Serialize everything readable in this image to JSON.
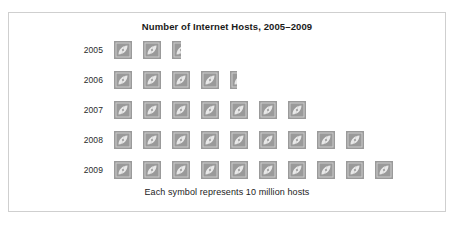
{
  "chart_data": {
    "type": "bar",
    "subtype": "pictograph",
    "title": "Number of Internet Hosts, 2005–2009",
    "caption": "Each symbol represents 10 million hosts",
    "symbol_name": "internet-host-symbol",
    "symbol_value": 10,
    "symbol_unit": "million hosts",
    "xlabel": "",
    "ylabel": "",
    "categories": [
      "2005",
      "2006",
      "2007",
      "2008",
      "2009"
    ],
    "values": [
      25,
      44,
      70,
      90,
      100
    ],
    "symbol_counts": [
      2.5,
      4.4,
      7,
      9,
      10
    ],
    "rows": [
      {
        "label": "2005",
        "symbols": 2.5,
        "hosts_millions": 25
      },
      {
        "label": "2006",
        "symbols": 4.4,
        "hosts_millions": 44
      },
      {
        "label": "2007",
        "symbols": 7,
        "hosts_millions": 70
      },
      {
        "label": "2008",
        "symbols": 9,
        "hosts_millions": 90
      },
      {
        "label": "2009",
        "symbols": 10,
        "hosts_millions": 100
      }
    ],
    "colors": {
      "symbol_fill": "#9a9a9a",
      "symbol_inner": "#cccccc",
      "frame_border": "#cfcfcf",
      "background": "#ffffff",
      "text": "#1a1a1a"
    },
    "grid": false,
    "legend": "none"
  }
}
